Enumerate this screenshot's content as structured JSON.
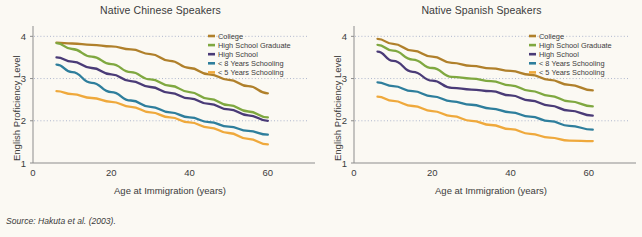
{
  "figure": {
    "source_note": "Source: Hakuta et al. (2003).",
    "background_color": "#fbf9f3"
  },
  "series_colors": {
    "College": "#b0802b",
    "High School Graduate": "#7fa840",
    "High School": "#4a3b77",
    "< 8 Years Schooling": "#2e7e9c",
    "< 5 Years Schooling": "#efa93c"
  },
  "chart_data": [
    {
      "type": "line",
      "title": "Native Chinese Speakers",
      "xlabel": "Age at Immigration (years)",
      "ylabel": "English Proficiency Level",
      "xlim": [
        0,
        70
      ],
      "ylim": [
        1,
        4.15
      ],
      "xticks": [
        0,
        20,
        40,
        60
      ],
      "yticks": [
        1,
        2,
        3,
        4
      ],
      "gridlines_y": [
        2,
        3,
        4
      ],
      "grid": "dotted-horizontal",
      "legend_position": "top-right",
      "x": [
        6,
        10,
        15,
        20,
        25,
        30,
        35,
        40,
        45,
        50,
        55,
        60
      ],
      "series": [
        {
          "name": "College",
          "color": "#b0802b",
          "values": [
            3.85,
            3.83,
            3.8,
            3.76,
            3.69,
            3.58,
            3.42,
            3.25,
            3.1,
            2.97,
            2.82,
            2.65
          ]
        },
        {
          "name": "High School Graduate",
          "color": "#7fa840",
          "values": [
            3.84,
            3.7,
            3.52,
            3.34,
            3.15,
            2.98,
            2.83,
            2.68,
            2.52,
            2.37,
            2.22,
            2.08
          ]
        },
        {
          "name": "High School",
          "color": "#4a3b77",
          "values": [
            3.5,
            3.4,
            3.25,
            3.1,
            2.94,
            2.8,
            2.66,
            2.53,
            2.4,
            2.27,
            2.13,
            2.0
          ]
        },
        {
          "name": "< 8 Years Schooling",
          "color": "#2e7e9c",
          "values": [
            3.33,
            3.15,
            2.9,
            2.68,
            2.48,
            2.33,
            2.2,
            2.08,
            1.97,
            1.86,
            1.76,
            1.67
          ]
        },
        {
          "name": "< 5 Years Schooling",
          "color": "#efa93c",
          "values": [
            2.7,
            2.63,
            2.54,
            2.45,
            2.33,
            2.2,
            2.08,
            1.96,
            1.84,
            1.71,
            1.57,
            1.44
          ]
        }
      ]
    },
    {
      "type": "line",
      "title": "Native Spanish Speakers",
      "xlabel": "Age at Immigration (years)",
      "ylabel": "English Proficiency Level",
      "xlim": [
        0,
        70
      ],
      "ylim": [
        1,
        4.15
      ],
      "xticks": [
        0,
        20,
        40,
        60
      ],
      "yticks": [
        1,
        2,
        3,
        4
      ],
      "gridlines_y": [
        2,
        3,
        4
      ],
      "grid": "dotted-horizontal",
      "legend_position": "top-right",
      "x": [
        6,
        10,
        15,
        20,
        25,
        30,
        35,
        40,
        45,
        50,
        55,
        61
      ],
      "series": [
        {
          "name": "College",
          "color": "#b0802b",
          "values": [
            3.94,
            3.82,
            3.66,
            3.52,
            3.37,
            3.3,
            3.24,
            3.18,
            3.09,
            2.97,
            2.85,
            2.72
          ]
        },
        {
          "name": "High School Graduate",
          "color": "#7fa840",
          "values": [
            3.8,
            3.66,
            3.45,
            3.25,
            3.04,
            3.0,
            2.94,
            2.84,
            2.71,
            2.59,
            2.46,
            2.34
          ]
        },
        {
          "name": "High School",
          "color": "#4a3b77",
          "values": [
            3.64,
            3.42,
            3.16,
            2.95,
            2.78,
            2.74,
            2.7,
            2.6,
            2.48,
            2.36,
            2.24,
            2.12
          ]
        },
        {
          "name": "< 8 Years Schooling",
          "color": "#2e7e9c",
          "values": [
            2.91,
            2.82,
            2.7,
            2.58,
            2.46,
            2.38,
            2.29,
            2.2,
            2.1,
            1.99,
            1.88,
            1.79
          ]
        },
        {
          "name": "< 5 Years Schooling",
          "color": "#efa93c",
          "values": [
            2.57,
            2.47,
            2.35,
            2.23,
            2.11,
            2.0,
            1.9,
            1.8,
            1.69,
            1.6,
            1.53,
            1.52
          ]
        }
      ]
    }
  ]
}
